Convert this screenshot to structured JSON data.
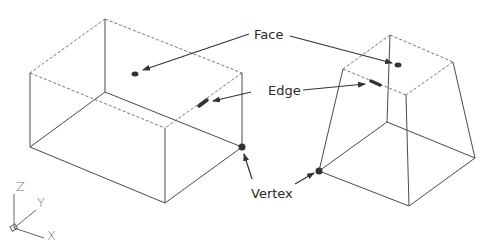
{
  "diagram": {
    "title": "",
    "labels": {
      "face": "Face",
      "edge": "Edge",
      "vertex": "Vertex"
    },
    "axes": {
      "z": "Z",
      "y": "Y",
      "x": "X"
    },
    "shapes": [
      {
        "name": "rectangular-box",
        "type": "wireframe-box"
      },
      {
        "name": "truncated-pyramid",
        "type": "wireframe-frustum"
      }
    ],
    "colors": {
      "line": "#4a4a4a",
      "hidden_line": "#777777",
      "marker": "#333333",
      "text": "#2a2a2a"
    }
  }
}
